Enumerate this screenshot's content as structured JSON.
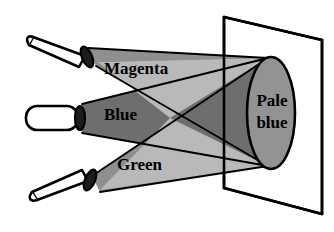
{
  "figure": {
    "background_color": "#ffffff",
    "width": 334,
    "height": 232
  },
  "labels": {
    "beam_top": "Magenta",
    "beam_middle": "Blue",
    "beam_bottom": "Green",
    "spot_line1": "Pale",
    "spot_line2": "blue"
  },
  "colors": {
    "outline": "#000000",
    "torch_body": "#ffffff",
    "torch_cap": "#1c1c1c",
    "beam_dark": "#6e6e6e",
    "beam_medium": "#8f8f8f",
    "beam_light": "#b9b9b9",
    "spot_fill": "#939393",
    "screen_fill": "#ffffff"
  },
  "elements": {
    "screen_name": "projection-screen",
    "spot_name": "pale-blue-spot",
    "torch_top_name": "torch-magenta",
    "torch_middle_name": "torch-blue",
    "torch_bottom_name": "torch-green"
  }
}
